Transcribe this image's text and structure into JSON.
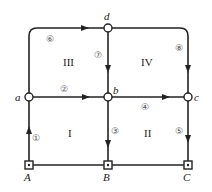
{
  "diagram": {
    "type": "directed-network",
    "nodes": [
      {
        "id": "a",
        "label": "a",
        "shape": "circle",
        "x": 29,
        "y": 97
      },
      {
        "id": "b",
        "label": "b",
        "shape": "circle",
        "x": 108,
        "y": 97
      },
      {
        "id": "c",
        "label": "c",
        "shape": "circle",
        "x": 188,
        "y": 97
      },
      {
        "id": "d",
        "label": "d",
        "shape": "circle",
        "x": 108,
        "y": 28
      },
      {
        "id": "A",
        "label": "A",
        "shape": "square",
        "x": 29,
        "y": 165
      },
      {
        "id": "B",
        "label": "B",
        "shape": "square",
        "x": 108,
        "y": 165
      },
      {
        "id": "C",
        "label": "C",
        "shape": "square",
        "x": 188,
        "y": 165
      }
    ],
    "edges": [
      {
        "id": "1",
        "label": "①",
        "from": "A",
        "to": "a"
      },
      {
        "id": "2",
        "label": "②",
        "from": "a",
        "to": "b"
      },
      {
        "id": "3",
        "label": "③",
        "from": "b",
        "to": "B"
      },
      {
        "id": "4",
        "label": "④",
        "from": "b",
        "to": "c"
      },
      {
        "id": "5",
        "label": "⑤",
        "from": "c",
        "to": "C"
      },
      {
        "id": "6",
        "label": "⑥",
        "from": "a",
        "to": "d"
      },
      {
        "id": "7",
        "label": "⑦",
        "from": "d",
        "to": "b"
      },
      {
        "id": "8",
        "label": "⑧",
        "from": "d",
        "to": "c"
      }
    ],
    "undirected_edges": [
      {
        "from": "A",
        "to": "B"
      },
      {
        "from": "B",
        "to": "C"
      }
    ],
    "regions": [
      {
        "id": "I",
        "label": "I"
      },
      {
        "id": "II",
        "label": "II"
      },
      {
        "id": "III",
        "label": "III"
      },
      {
        "id": "IV",
        "label": "IV"
      }
    ]
  }
}
